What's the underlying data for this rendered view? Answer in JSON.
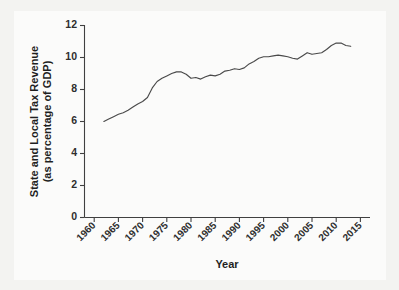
{
  "chart_data": {
    "type": "line",
    "title": "",
    "xlabel": "Year",
    "ylabel": "State and Local Tax Revenue\n(as percentage of GDP)",
    "ylabel_line1": "State and Local Tax Revenue",
    "ylabel_line2": "(as percentage of GDP)",
    "xlim": [
      1958,
      2017
    ],
    "ylim": [
      0,
      12
    ],
    "grid": false,
    "legend": false,
    "line_color": "#4a4a4a",
    "frame_color": "#3a3a3a",
    "background_color": "#fbfbfa",
    "yticks": [
      0,
      2,
      4,
      6,
      8,
      10,
      12
    ],
    "ytick_labels": [
      "0",
      "2",
      "4",
      "6",
      "8",
      "10",
      "12"
    ],
    "xticks": [
      1960,
      1965,
      1970,
      1975,
      1980,
      1985,
      1990,
      1995,
      2000,
      2005,
      2010,
      2015
    ],
    "xtick_labels": [
      "1960",
      "1965",
      "1970",
      "1975",
      "1980",
      "1985",
      "1990",
      "1995",
      "2000",
      "2005",
      "2010",
      "2015"
    ],
    "xtick_rotation": 45,
    "series": [
      {
        "name": "State and Local Tax Revenue",
        "x": [
          1962,
          1963,
          1964,
          1965,
          1966,
          1967,
          1968,
          1969,
          1970,
          1971,
          1972,
          1973,
          1974,
          1975,
          1976,
          1977,
          1978,
          1979,
          1980,
          1981,
          1982,
          1983,
          1984,
          1985,
          1986,
          1987,
          1988,
          1989,
          1990,
          1991,
          1992,
          1993,
          1994,
          1995,
          1996,
          1997,
          1998,
          1999,
          2000,
          2001,
          2002,
          2003,
          2004,
          2005,
          2006,
          2007,
          2008,
          2009,
          2010,
          2011,
          2012,
          2013
        ],
        "values": [
          6.0,
          6.15,
          6.3,
          6.45,
          6.55,
          6.7,
          6.9,
          7.1,
          7.25,
          7.5,
          8.1,
          8.5,
          8.7,
          8.85,
          9.0,
          9.1,
          9.1,
          8.95,
          8.7,
          8.75,
          8.65,
          8.8,
          8.9,
          8.85,
          8.95,
          9.15,
          9.2,
          9.3,
          9.25,
          9.35,
          9.6,
          9.75,
          9.95,
          10.05,
          10.05,
          10.1,
          10.15,
          10.1,
          10.05,
          9.95,
          9.9,
          10.1,
          10.3,
          10.2,
          10.25,
          10.3,
          10.5,
          10.75,
          10.9,
          10.9,
          10.75,
          10.7
        ]
      }
    ]
  },
  "axis": {
    "y_title_line1": "State and Local Tax Revenue",
    "y_title_line2": "(as percentage of GDP)",
    "x_title": "Year"
  }
}
